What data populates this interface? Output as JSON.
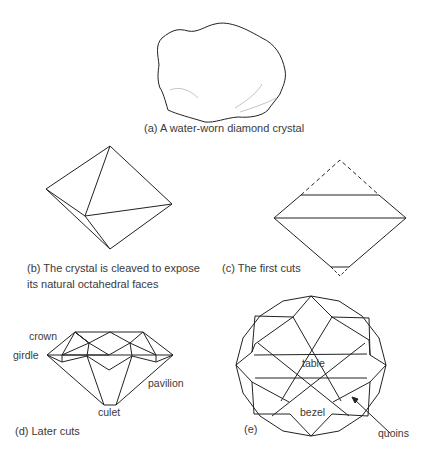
{
  "panels": {
    "a": {
      "caption": "(a) A water-worn diamond crystal"
    },
    "b": {
      "caption_line1": "(b) The crystal is cleaved to expose",
      "caption_line2": "its natural octahedral faces"
    },
    "c": {
      "caption": "(c) The first cuts"
    },
    "d": {
      "caption": "(d) Later cuts",
      "labels": {
        "crown": "crown",
        "girdle": "girdle",
        "pavilion": "pavilion",
        "culet": "culet"
      }
    },
    "e": {
      "caption": "(e)",
      "labels": {
        "table": "table",
        "bezel": "bezel",
        "quoins": "quoins"
      }
    }
  },
  "colors": {
    "line": "#222222",
    "text": "#3a3a3a"
  }
}
